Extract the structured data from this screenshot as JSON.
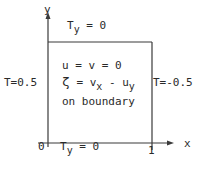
{
  "diagram": {
    "axes": {
      "y_label": "y",
      "x_label": "x",
      "origin_label": "0",
      "x_tick_label": "1"
    },
    "boundary_conditions": {
      "top": {
        "base": "T",
        "sub": "y",
        "rest": " = 0"
      },
      "bottom": {
        "base": "T",
        "sub": "y",
        "rest": " = 0"
      },
      "left": "T=0.5",
      "right": "T=-0.5"
    },
    "interior": {
      "line1": "u = v = 0",
      "line2": {
        "zeta": "ζ",
        "eq": " = v",
        "sub1": "x",
        "minus": " - u",
        "sub2": "y"
      },
      "line3": "on boundary"
    },
    "colors": {
      "line": "#3a3a3a",
      "text": "#2a2a2a"
    }
  }
}
